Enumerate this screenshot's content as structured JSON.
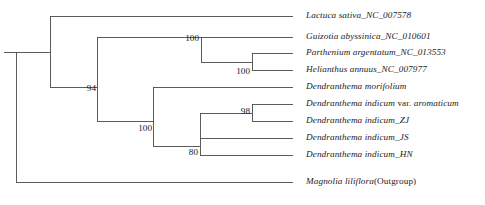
{
  "figure": {
    "kind": "phylogenetic-tree",
    "layout": "rectangular-cladogram",
    "orientation": "left-to-right",
    "line_color": "#4a4a4a",
    "text_color": "#1b1b1b",
    "background": "#ffffff"
  },
  "taxa": [
    {
      "id": "lactuca_sativa",
      "label": "Lactuca sativa_NC_007578",
      "italic_part": "Lactuca sativa_NC_007578",
      "upright_part": "",
      "x_tip": 293,
      "y": 16,
      "label_x": 306
    },
    {
      "id": "guizotia_abyssinica",
      "label": "Guizotia abyssinica_NC_010601",
      "italic_part": "Guizotia abyssinica_NC_010601",
      "upright_part": "",
      "x_tip": 293,
      "y": 37,
      "label_x": 306
    },
    {
      "id": "parthenium_argentatum",
      "label": "Parthenium argentatum_NC_013553",
      "italic_part": "Parthenium argentatum_NC_013553",
      "upright_part": "",
      "x_tip": 293,
      "y": 53,
      "label_x": 306
    },
    {
      "id": "helianthus_annuus",
      "label": "Helianthus annuus_NC_007977",
      "italic_part": "Helianthus annuus_NC_007977",
      "upright_part": "",
      "x_tip": 293,
      "y": 70,
      "label_x": 306
    },
    {
      "id": "dendranthema_morifolium",
      "label": "Dendranthema morifolium",
      "italic_part": "Dendranthema morifolium",
      "upright_part": "",
      "x_tip": 293,
      "y": 87,
      "label_x": 306
    },
    {
      "id": "dendranthema_indicum_aromaticum",
      "label": "Dendranthema indicum var. aromaticum",
      "italic_part": "Dendranthema indicum ",
      "upright_part": "var.",
      "italic_tail": " aromaticum",
      "x_tip": 293,
      "y": 104,
      "label_x": 306
    },
    {
      "id": "dendranthema_indicum_zj",
      "label": "Dendranthema indicum_ZJ",
      "italic_part": "Dendranthema indicum_ZJ",
      "upright_part": "",
      "x_tip": 293,
      "y": 121,
      "label_x": 306
    },
    {
      "id": "dendranthema_indicum_js",
      "label": "Dendranthema indicum_JS",
      "italic_part": "Dendranthema indicum_JS",
      "upright_part": "",
      "x_tip": 293,
      "y": 138,
      "label_x": 306
    },
    {
      "id": "dendranthema_indicum_hn",
      "label": "Dendranthema indicum_HN",
      "italic_part": "Dendranthema indicum_HN",
      "upright_part": "",
      "x_tip": 293,
      "y": 155,
      "label_x": 306
    },
    {
      "id": "magnolia_liliflora",
      "label": "Magnolia liliflora(Outgroup)",
      "italic_part": "Magnolia liliflora",
      "upright_part": "(Outgroup)",
      "x_tip": 293,
      "y": 182,
      "label_x": 306
    }
  ],
  "support_values": [
    {
      "id": "support-asteraceae",
      "value": "94",
      "x": 96,
      "y": 89,
      "anchor_node": "node-asteraceae"
    },
    {
      "id": "support-core-asteraceae",
      "value": "100",
      "x": 152,
      "y": 129,
      "anchor_node": "node-core-split"
    },
    {
      "id": "support-heliantheae",
      "value": "100",
      "x": 199,
      "y": 39,
      "anchor_node": "node-guizotia-clade"
    },
    {
      "id": "support-parthenium-helianthus",
      "value": "100",
      "x": 250,
      "y": 72,
      "anchor_node": "node-parth-helia"
    },
    {
      "id": "support-indicum-pair",
      "value": "98",
      "x": 250,
      "y": 112,
      "anchor_node": "node-aromaticum-zj"
    },
    {
      "id": "support-indicum-clade",
      "value": "80",
      "x": 198,
      "y": 153,
      "anchor_node": "node-indicum"
    }
  ],
  "nodes": [
    {
      "id": "node-root",
      "x": 16,
      "y_top": 52,
      "y_bottom": 182
    },
    {
      "id": "node-asteraceae",
      "x": 50,
      "y_top": 16,
      "y_bottom": 87
    },
    {
      "id": "node-core-split",
      "x": 97,
      "y_top": 37,
      "y_bottom": 121
    },
    {
      "id": "node-guizotia-clade",
      "x": 201,
      "y_top": 37,
      "y_bottom": 62
    },
    {
      "id": "node-parth-helia",
      "x": 252,
      "y_top": 53,
      "y_bottom": 70
    },
    {
      "id": "node-dendranthema",
      "x": 153,
      "y_top": 87,
      "y_bottom": 146
    },
    {
      "id": "node-indicum",
      "x": 200,
      "y_top": 113,
      "y_bottom": 155
    },
    {
      "id": "node-aromaticum-zj",
      "x": 252,
      "y_top": 104,
      "y_bottom": 121
    }
  ],
  "branches": [
    {
      "id": "branch-root-stem",
      "x1": 4,
      "x2": 16,
      "y": 52
    },
    {
      "id": "branch-root-to-asteraceae",
      "x1": 16,
      "x2": 50,
      "y": 52
    },
    {
      "id": "branch-root-to-outgroup",
      "x1": 16,
      "x2": 293,
      "y": 182
    },
    {
      "id": "branch-to-lactuca",
      "x1": 50,
      "x2": 293,
      "y": 16
    },
    {
      "id": "branch-asteraceae-to-core",
      "x1": 50,
      "x2": 97,
      "y": 87
    },
    {
      "id": "branch-core-to-guizotia-clade",
      "x1": 97,
      "x2": 201,
      "y": 37
    },
    {
      "id": "branch-core-to-dendranthema",
      "x1": 97,
      "x2": 153,
      "y": 121
    },
    {
      "id": "branch-to-guizotia",
      "x1": 201,
      "x2": 293,
      "y": 37
    },
    {
      "id": "branch-guizotia-to-parth-helia",
      "x1": 201,
      "x2": 252,
      "y": 62
    },
    {
      "id": "branch-to-parthenium",
      "x1": 252,
      "x2": 293,
      "y": 53
    },
    {
      "id": "branch-to-helianthus",
      "x1": 252,
      "x2": 293,
      "y": 70
    },
    {
      "id": "branch-to-morifolium",
      "x1": 153,
      "x2": 293,
      "y": 87
    },
    {
      "id": "branch-dendranthema-to-indicum",
      "x1": 153,
      "x2": 200,
      "y": 146
    },
    {
      "id": "branch-indicum-to-pair",
      "x1": 200,
      "x2": 252,
      "y": 113
    },
    {
      "id": "branch-to-aromaticum",
      "x1": 252,
      "x2": 293,
      "y": 104
    },
    {
      "id": "branch-to-zj",
      "x1": 252,
      "x2": 293,
      "y": 121
    },
    {
      "id": "branch-to-js",
      "x1": 200,
      "x2": 293,
      "y": 138
    },
    {
      "id": "branch-to-hn",
      "x1": 200,
      "x2": 293,
      "y": 155
    }
  ]
}
